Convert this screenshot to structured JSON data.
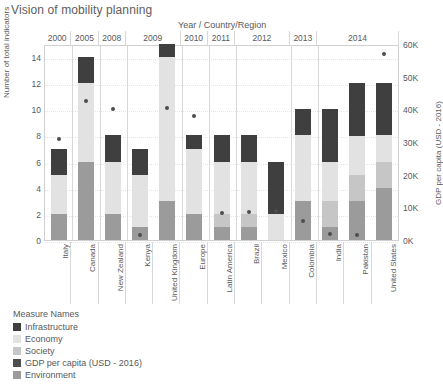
{
  "title": "Vision of mobility planning",
  "header": {
    "caption": "Year  /  Country/Region"
  },
  "axes": {
    "left": {
      "title": "Number of total indicators",
      "ticks": [
        "0",
        "2",
        "4",
        "6",
        "8",
        "10",
        "12",
        "14"
      ],
      "min": 0,
      "max": 15
    },
    "right": {
      "title": "GDP per capita (USD - 2016)",
      "ticks": [
        "0K",
        "10K",
        "20K",
        "30K",
        "40K",
        "50K",
        "60K"
      ],
      "min": 0,
      "max": 60000
    }
  },
  "legend": {
    "title": "Measure Names",
    "items": [
      {
        "label": "Infrastructure",
        "color": "#3f3f40"
      },
      {
        "label": "Economy",
        "color": "#e2e2e2"
      },
      {
        "label": "Society",
        "color": "#c6c6c6"
      },
      {
        "label": "GDP per capita (USD - 2016)",
        "color": "#4d4d4d"
      },
      {
        "label": "Environment",
        "color": "#9b9b9b"
      }
    ]
  },
  "years": [
    {
      "label": "2000",
      "span": 1
    },
    {
      "label": "2005",
      "span": 1
    },
    {
      "label": "2008",
      "span": 1
    },
    {
      "label": "2009",
      "span": 2
    },
    {
      "label": "2010",
      "span": 1
    },
    {
      "label": "2011",
      "span": 1
    },
    {
      "label": "2012",
      "span": 2
    },
    {
      "label": "2013",
      "span": 1
    },
    {
      "label": "2014",
      "span": 3
    }
  ],
  "chart_data": {
    "type": "bar",
    "title": "Vision of mobility planning",
    "xlabel": "Year / Country/Region",
    "ylabel": "Number of total indicators",
    "y2label": "GDP per capita (USD - 2016)",
    "ylim": [
      0,
      15
    ],
    "y2lim": [
      0,
      60000
    ],
    "grid": true,
    "legend_position": "bottom-left",
    "stacking_order_bottom_to_top": [
      "Environment",
      "Society",
      "Economy",
      "Infrastructure"
    ],
    "categories": [
      "Italy",
      "Canada",
      "New Zealand",
      "Kenya",
      "United Kingdom",
      "Europe",
      "Latin America",
      "Brazil",
      "Mexico",
      "Colombia",
      "India",
      "Pakistan",
      "United States"
    ],
    "category_years": [
      "2000",
      "2005",
      "2008",
      "2009",
      "2009",
      "2010",
      "2011",
      "2012",
      "2012",
      "2013",
      "2014",
      "2014",
      "2014"
    ],
    "series": [
      {
        "name": "Environment",
        "color": "#9b9b9b",
        "values": [
          2,
          6,
          2,
          1,
          3,
          2,
          1,
          1,
          0,
          3,
          1,
          3,
          4
        ]
      },
      {
        "name": "Society",
        "color": "#c6c6c6",
        "values": [
          0,
          0,
          0,
          0,
          0,
          0,
          1,
          1,
          0,
          0,
          2,
          2,
          2
        ]
      },
      {
        "name": "Economy",
        "color": "#e2e2e2",
        "values": [
          3,
          6,
          4,
          4,
          11,
          5,
          4,
          4,
          2,
          5,
          3,
          3,
          2
        ]
      },
      {
        "name": "Infrastructure",
        "color": "#3f3f40",
        "values": [
          2,
          2,
          2,
          2,
          1,
          1,
          2,
          2,
          4,
          2,
          4,
          4,
          4
        ]
      }
    ],
    "totals": [
      7,
      14,
      8,
      7,
      15,
      8,
      8,
      8,
      6,
      10,
      10,
      12,
      12
    ],
    "gdp_series": {
      "name": "GDP per capita (USD - 2016)",
      "marker": "circle",
      "color": "#4d4d4d",
      "values": [
        31000,
        42500,
        40000,
        1400,
        40500,
        38000,
        8200,
        8700,
        8800,
        5900,
        1700,
        1500,
        57000
      ]
    }
  },
  "bars": [
    {
      "country": "Italy",
      "year": "2000",
      "total": 7,
      "segments": [
        {
          "name": "Environment",
          "value": 2
        },
        {
          "name": "Economy",
          "value": 3
        },
        {
          "name": "Infrastructure",
          "value": 2
        }
      ],
      "gdp": 31000
    },
    {
      "country": "Canada",
      "year": "2005",
      "total": 14,
      "segments": [
        {
          "name": "Environment",
          "value": 6
        },
        {
          "name": "Economy",
          "value": 6
        },
        {
          "name": "Infrastructure",
          "value": 2
        }
      ],
      "gdp": 42500
    },
    {
      "country": "New Zealand",
      "year": "2008",
      "total": 8,
      "segments": [
        {
          "name": "Environment",
          "value": 2
        },
        {
          "name": "Economy",
          "value": 4
        },
        {
          "name": "Infrastructure",
          "value": 2
        }
      ],
      "gdp": 40000
    },
    {
      "country": "Kenya",
      "year": "2009",
      "total": 7,
      "segments": [
        {
          "name": "Environment",
          "value": 1
        },
        {
          "name": "Economy",
          "value": 4
        },
        {
          "name": "Infrastructure",
          "value": 2
        }
      ],
      "gdp": 1400
    },
    {
      "country": "United Kingdom",
      "year": "2009",
      "total": 15,
      "segments": [
        {
          "name": "Environment",
          "value": 3
        },
        {
          "name": "Economy",
          "value": 11
        },
        {
          "name": "Infrastructure",
          "value": 1
        }
      ],
      "gdp": 40500
    },
    {
      "country": "Europe",
      "year": "2010",
      "total": 8,
      "segments": [
        {
          "name": "Environment",
          "value": 2
        },
        {
          "name": "Economy",
          "value": 5
        },
        {
          "name": "Infrastructure",
          "value": 1
        }
      ],
      "gdp": 38000
    },
    {
      "country": "Latin America",
      "year": "2011",
      "total": 8,
      "segments": [
        {
          "name": "Environment",
          "value": 1
        },
        {
          "name": "Society",
          "value": 1
        },
        {
          "name": "Economy",
          "value": 4
        },
        {
          "name": "Infrastructure",
          "value": 2
        }
      ],
      "gdp": 8200
    },
    {
      "country": "Brazil",
      "year": "2012",
      "total": 8,
      "segments": [
        {
          "name": "Environment",
          "value": 1
        },
        {
          "name": "Society",
          "value": 1
        },
        {
          "name": "Economy",
          "value": 4
        },
        {
          "name": "Infrastructure",
          "value": 2
        }
      ],
      "gdp": 8700
    },
    {
      "country": "Mexico",
      "year": "2012",
      "total": 6,
      "segments": [
        {
          "name": "Economy",
          "value": 2
        },
        {
          "name": "Infrastructure",
          "value": 4
        }
      ],
      "gdp": 8800
    },
    {
      "country": "Colombia",
      "year": "2013",
      "total": 10,
      "segments": [
        {
          "name": "Environment",
          "value": 3
        },
        {
          "name": "Economy",
          "value": 5
        },
        {
          "name": "Infrastructure",
          "value": 2
        }
      ],
      "gdp": 5900
    },
    {
      "country": "India",
      "year": "2014",
      "total": 10,
      "segments": [
        {
          "name": "Environment",
          "value": 1
        },
        {
          "name": "Society",
          "value": 2
        },
        {
          "name": "Economy",
          "value": 3
        },
        {
          "name": "Infrastructure",
          "value": 4
        }
      ],
      "gdp": 1700
    },
    {
      "country": "Pakistan",
      "year": "2014",
      "total": 12,
      "segments": [
        {
          "name": "Environment",
          "value": 3
        },
        {
          "name": "Society",
          "value": 2
        },
        {
          "name": "Economy",
          "value": 3
        },
        {
          "name": "Infrastructure",
          "value": 4
        }
      ],
      "gdp": 1500
    },
    {
      "country": "United States",
      "year": "2014",
      "total": 12,
      "segments": [
        {
          "name": "Environment",
          "value": 4
        },
        {
          "name": "Society",
          "value": 2
        },
        {
          "name": "Economy",
          "value": 2
        },
        {
          "name": "Infrastructure",
          "value": 4
        }
      ],
      "gdp": 57000
    }
  ]
}
